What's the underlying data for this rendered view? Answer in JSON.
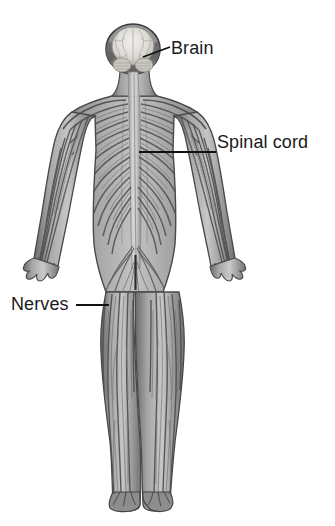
{
  "figure": {
    "view": "posterior full body",
    "background_color": "#ffffff",
    "illustration_style": "grayscale pencil rendering"
  },
  "labels": [
    {
      "id": "brain",
      "text": "Brain",
      "x": 171,
      "y": 38,
      "leader": {
        "type": "diagonal",
        "from_x": 143,
        "from_y": 57,
        "to_x": 170,
        "to_y": 47
      }
    },
    {
      "id": "spinal-cord",
      "text": "Spinal cord",
      "x": 217,
      "y": 132,
      "leader": {
        "type": "horizontal",
        "from_x": 139,
        "from_y": 152,
        "to_x": 216,
        "to_y": 152
      }
    },
    {
      "id": "nerves",
      "text": "Nerves",
      "x": 11,
      "y": 294,
      "leader": {
        "type": "horizontal",
        "from_x": 76,
        "from_y": 305,
        "to_x": 109,
        "to_y": 305
      }
    }
  ],
  "anatomy": {
    "head": {
      "label": "skull-and-brain",
      "cx": 133,
      "cy": 50,
      "rx": 26,
      "ry": 24
    },
    "brain": {
      "label": "brain-hemispheres",
      "cx": 133,
      "cy": 47,
      "rx": 20,
      "ry": 18
    },
    "neck": {
      "label": "neck",
      "top_y": 72,
      "bottom_y": 100
    },
    "torso": {
      "label": "torso-ribcage-nerves",
      "top_y": 100,
      "bottom_y": 250
    },
    "spinal_cord": {
      "label": "spinal-cord-column",
      "x": 142,
      "top_y": 74,
      "bottom_y": 282
    },
    "left_arm": {
      "label": "left-arm",
      "top_y": 112,
      "hand_y": 268
    },
    "right_arm": {
      "label": "right-arm",
      "top_y": 112,
      "hand_y": 268
    },
    "pelvis": {
      "label": "pelvis-lumbar-plexus",
      "top_y": 250,
      "bottom_y": 300
    },
    "left_leg": {
      "label": "left-leg",
      "top_y": 300,
      "foot_y": 510
    },
    "right_leg": {
      "label": "right-leg",
      "top_y": 300,
      "foot_y": 510
    }
  },
  "colors": {
    "label_text": "#1a1a1a",
    "leader_line": "#111111",
    "body_light": "#cfcfcf",
    "body_mid": "#9a9a9a",
    "body_dark": "#6d6d6d",
    "body_outline": "#4a4a4a",
    "brain_tissue": "#e2e0dc",
    "background": "#ffffff"
  }
}
